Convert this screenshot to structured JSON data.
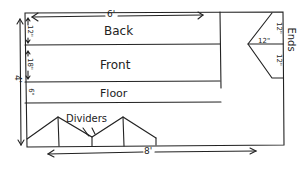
{
  "diagram": {
    "panels": [
      {
        "name": "Back",
        "height": "12\""
      },
      {
        "name": "Front",
        "height": "18\""
      },
      {
        "name": "Floor",
        "height": "6\""
      }
    ],
    "top_width": "6'",
    "total_height": "4'",
    "bottom_width": "8'",
    "dividers_label": "Dividers",
    "ends_label": "Ends",
    "ends_dims": {
      "top": "12\"",
      "middle": "12\"",
      "bottom": "12\""
    }
  }
}
